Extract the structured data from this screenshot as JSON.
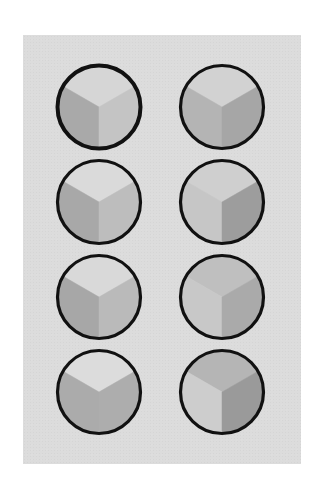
{
  "figure": {
    "background_color": "#ffffff",
    "paper_color": "#dcdcdc",
    "ring_color": "#111111",
    "layout": {
      "columns": 2,
      "rows": 4,
      "column_centers_x": [
        99,
        222
      ],
      "row_centers_y": [
        107,
        202,
        297,
        392
      ],
      "radius": 43
    },
    "circles": [
      {
        "id": "r1-left",
        "row": 1,
        "col": 1,
        "cx": 99,
        "cy": 107,
        "top": "#d6d6d6",
        "left": "#a9a9a9",
        "right": "#c4c4c4"
      },
      {
        "id": "r1-right",
        "row": 1,
        "col": 2,
        "cx": 222,
        "cy": 107,
        "top": "#d2d2d2",
        "left": "#b4b4b4",
        "right": "#a6a6a6"
      },
      {
        "id": "r2-left",
        "row": 2,
        "col": 1,
        "cx": 99,
        "cy": 202,
        "top": "#dadada",
        "left": "#a8a8a8",
        "right": "#bdbdbd"
      },
      {
        "id": "r2-right",
        "row": 2,
        "col": 2,
        "cx": 222,
        "cy": 202,
        "top": "#cfcfcf",
        "left": "#c6c6c6",
        "right": "#9d9d9d"
      },
      {
        "id": "r3-left",
        "row": 3,
        "col": 1,
        "cx": 99,
        "cy": 297,
        "top": "#d9d9d9",
        "left": "#a7a7a7",
        "right": "#bababa"
      },
      {
        "id": "r3-right",
        "row": 3,
        "col": 2,
        "cx": 222,
        "cy": 297,
        "top": "#bfbfbf",
        "left": "#c8c8c8",
        "right": "#aaaaaa"
      },
      {
        "id": "r4-left",
        "row": 4,
        "col": 1,
        "cx": 99,
        "cy": 392,
        "top": "#dcdcdc",
        "left": "#ababab",
        "right": "#adadad"
      },
      {
        "id": "r4-right",
        "row": 4,
        "col": 2,
        "cx": 222,
        "cy": 392,
        "top": "#b5b5b5",
        "left": "#cdcdcd",
        "right": "#9a9a9a"
      }
    ]
  }
}
